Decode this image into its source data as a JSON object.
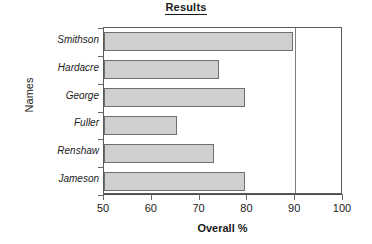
{
  "chart_data": {
    "type": "bar",
    "orientation": "horizontal",
    "title": "Results",
    "xlabel": "Overall %",
    "ylabel": "Names",
    "categories": [
      "Smithson",
      "Hardacre",
      "George",
      "Fuller",
      "Renshaw",
      "Jameson"
    ],
    "values": [
      89.5,
      74,
      79.5,
      65.3,
      73,
      79.5
    ],
    "series": [
      {
        "name": "Overall %",
        "values": [
          89.5,
          74,
          79.5,
          65.3,
          73,
          79.5
        ]
      }
    ],
    "xlim": [
      50,
      100
    ],
    "xticks": [
      50,
      60,
      70,
      80,
      90,
      100
    ],
    "xtick_labels": [
      "50",
      "60",
      "70",
      "80",
      "90",
      "100"
    ],
    "grid": "vertical-at-90",
    "legend": "none",
    "bar_fill_color": "#cfcfcf",
    "bar_border_color": "#6f6f6f",
    "axis_color": "#5a5a5a",
    "text_color": "#1a1a1a"
  },
  "chart": {
    "title": "Results",
    "x_axis_title": "Overall %",
    "y_axis_title": "Names"
  }
}
